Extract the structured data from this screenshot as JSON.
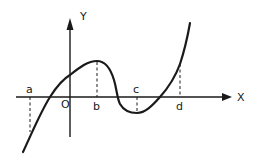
{
  "diagram": {
    "type": "function-graph",
    "axes": {
      "x_label": "X",
      "y_label": "Y",
      "origin_label": "O"
    },
    "points": [
      {
        "label": "a",
        "note": "dashed line from axis down to curve"
      },
      {
        "label": "b",
        "note": "dashed line from curve (local maximum) down to axis"
      },
      {
        "label": "c",
        "note": "dashed line from axis down to curve (local minimum)"
      },
      {
        "label": "d",
        "note": "dashed line from curve down to axis"
      }
    ],
    "colors": {
      "ink": "#1a1a1a",
      "background": "#ffffff"
    }
  }
}
